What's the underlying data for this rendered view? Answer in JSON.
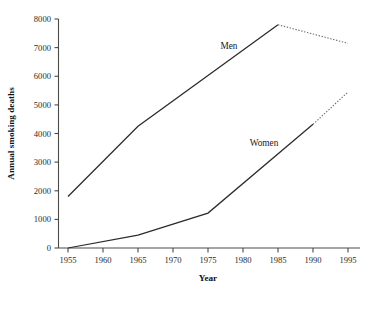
{
  "chart_data": {
    "type": "line",
    "title": "",
    "xlabel": "Year",
    "ylabel": "Annual smoking deaths",
    "x": [
      1955,
      1960,
      1965,
      1970,
      1975,
      1980,
      1985,
      1990,
      1995
    ],
    "xlim": [
      1953,
      1995
    ],
    "ylim": [
      0,
      8000
    ],
    "xticks": [
      "1955",
      "1960",
      "1965",
      "1970",
      "1975",
      "1980",
      "1985",
      "1990",
      "1995"
    ],
    "yticks": [
      "0",
      "1000",
      "2000",
      "3000",
      "4000",
      "5000",
      "6000",
      "7000",
      "8000"
    ],
    "grid": false,
    "legend_position": "inline-labels",
    "series": [
      {
        "name": "Men",
        "label": "Men",
        "label_x": 1978,
        "label_y": 6950,
        "color": "#2b2b2b",
        "points": [
          {
            "x": 1955,
            "y": 1800
          },
          {
            "x": 1965,
            "y": 4250
          },
          {
            "x": 1985,
            "y": 7800
          }
        ],
        "projected_points": [
          {
            "x": 1985,
            "y": 7800
          },
          {
            "x": 1995,
            "y": 7150
          }
        ]
      },
      {
        "name": "Women",
        "label": "Women",
        "label_x": 1983,
        "label_y": 3580,
        "color": "#2b2b2b",
        "points": [
          {
            "x": 1955,
            "y": 0
          },
          {
            "x": 1965,
            "y": 450
          },
          {
            "x": 1975,
            "y": 1220
          },
          {
            "x": 1990,
            "y": 4320
          }
        ],
        "projected_points": [
          {
            "x": 1990,
            "y": 4320
          },
          {
            "x": 1995,
            "y": 5450
          }
        ]
      }
    ]
  },
  "axes": {
    "y_title": "Annual smoking deaths",
    "x_title": "Year",
    "y_tick_labels": [
      "8000",
      "7000",
      "6000",
      "5000",
      "4000",
      "3000",
      "2000",
      "1000",
      "0"
    ],
    "x_tick_labels": [
      "1955",
      "1960",
      "1965",
      "1970",
      "1975",
      "1980",
      "1985",
      "1990",
      "1995"
    ]
  },
  "annotations": {
    "men_label": "Men",
    "women_label": "Women"
  },
  "colors": {
    "line": "#2b2b2b",
    "projection": "#6d6d6d",
    "axis": "#4a4a4a",
    "text": "#1a1a1a",
    "background": "#ffffff"
  }
}
